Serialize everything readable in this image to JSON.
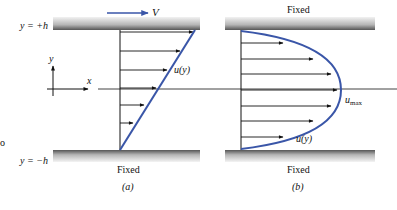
{
  "figure": {
    "panel_a": {
      "caption": "(a)",
      "top_label": "V",
      "top_plate_label": "y = +h",
      "bottom_plate_label": "y = −h",
      "bottom_text": "Fixed",
      "profile_label": "u(y)",
      "axis_y": "y",
      "axis_x": "x",
      "profile_type": "linear (Couette)"
    },
    "panel_b": {
      "caption": "(b)",
      "top_text": "Fixed",
      "bottom_text": "Fixed",
      "profile_label": "u(y)",
      "max_label_base": "u",
      "max_label_sub": "max",
      "profile_type": "parabolic (Poiseuille)"
    },
    "left_margin_fragments": [
      "o",
      "."
    ],
    "colors": {
      "profile": "#3a56a8",
      "arrow": "#111111",
      "plate_dark": "#6e6e6e",
      "plate_light": "#e6e6e6"
    }
  }
}
